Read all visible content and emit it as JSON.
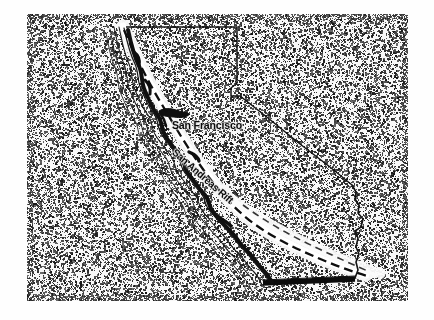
{
  "figure": {
    "kind": "scanned-map-illustration",
    "width": 434,
    "height": 320,
    "background_color": "#ffffff",
    "panel": {
      "name": "stippled-halftone-panel",
      "x": 27,
      "y": 14,
      "width": 381,
      "height": 287,
      "fill_color": "#f2f2f2",
      "stipple_color": "#2b2b2b",
      "description": "coarse scanned halftone / stipple texture filling the image field"
    }
  },
  "map": {
    "title_visible": false,
    "state_outline": {
      "name": "california-state-outline",
      "stroke_color": "#111111",
      "northern_border": "straight horizontal line at the top from the north coast east to the Oregon/Nevada corner",
      "eastern_border": "vertical Nevada line, a small notch at the Lake Tahoe corner, then a long diagonal running southeast",
      "colorado_river_border": "short stepped wiggle on the lower east edge",
      "southern_border": "thick straight black line marking the Mexico border"
    },
    "coastline": {
      "name": "pacific-coastline-contours",
      "stroke_color": "#111111",
      "contour_line_count": 5,
      "description": "four to five nested parallel contour lines paralleling the Pacific coast, with a heavy black shadow edge along the inland side"
    },
    "fault": {
      "name": "san-andreas-fault-line",
      "line_style": "dashed",
      "stroke_color": "#0d0d0d",
      "halo_color": "#f7f7f7",
      "description": "dashed black fault trace surrounded by a bright white halo band, running from the north coast southeast past San Francisco to the southern desert"
    },
    "bay": {
      "name": "san-francisco-bay",
      "fill_color": "#0f0f0f",
      "description": "small solid black bay shape just west of the San Francisco label"
    }
  },
  "labels": {
    "san_francisco": "San Francisco",
    "san_andreas_rift": "San Andreas Rift"
  }
}
